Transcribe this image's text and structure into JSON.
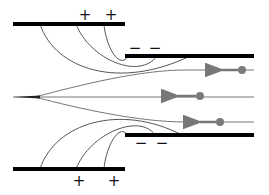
{
  "diagram": {
    "type": "electrostatic lens / electron focusing between charged plates",
    "colors": {
      "plate": "#000000",
      "field_line": "#555555",
      "electron": "#7a7a7a",
      "trajectory": "#777777"
    },
    "plates": [
      {
        "name": "upper-left-plate",
        "x1": 13,
        "x2": 125,
        "y": 24,
        "charge": "positive"
      },
      {
        "name": "upper-right-plate",
        "x1": 125,
        "x2": 254,
        "y": 56,
        "charge": "negative"
      },
      {
        "name": "lower-left-plate",
        "x1": 13,
        "x2": 125,
        "y": 169,
        "charge": "positive"
      },
      {
        "name": "lower-right-plate",
        "x1": 125,
        "x2": 254,
        "y": 135,
        "charge": "negative"
      }
    ],
    "labels": {
      "top_plus": [
        {
          "text": "+",
          "x": 85,
          "y": 15
        },
        {
          "text": "+",
          "x": 111,
          "y": 15
        }
      ],
      "top_minus": [
        {
          "text": "−",
          "x": 135,
          "y": 48
        },
        {
          "text": "−",
          "x": 155,
          "y": 48
        }
      ],
      "bottom_minus": [
        {
          "text": "−",
          "x": 141,
          "y": 143
        },
        {
          "text": "−",
          "x": 162,
          "y": 143
        }
      ],
      "bottom_plus": [
        {
          "text": "+",
          "x": 79,
          "y": 181
        },
        {
          "text": "+",
          "x": 114,
          "y": 181
        }
      ]
    },
    "electrons": [
      {
        "x": 242,
        "y": 70,
        "direction": "left"
      },
      {
        "x": 200,
        "y": 96,
        "direction": "left"
      },
      {
        "x": 220,
        "y": 122,
        "direction": "left"
      }
    ]
  }
}
